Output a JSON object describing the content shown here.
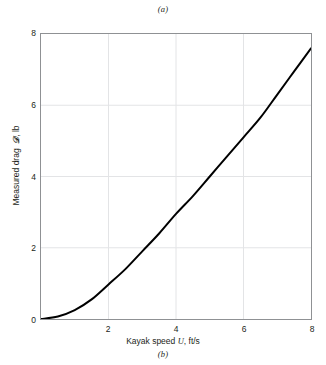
{
  "figure": {
    "caption_top": "(a)",
    "caption_bottom": "(b)",
    "background_color": "#ffffff",
    "frame_color": "#8f9194",
    "grid_color": "#e3e4e6",
    "curve_color": "#000000"
  },
  "axes": {
    "xlabel_prefix": "Kayak speed ",
    "xlabel_symbol": "U",
    "xlabel_suffix": ", ft/s",
    "ylabel_prefix": "Measured drag ",
    "ylabel_symbol": " 𝒟",
    "ylabel_suffix": ", lb",
    "xticks": [
      "2",
      "4",
      "6",
      "8"
    ],
    "yticks": [
      "0",
      "2",
      "4",
      "6",
      "8"
    ]
  },
  "chart_data": {
    "type": "line",
    "title": "",
    "subtitle": "",
    "xlabel": "Kayak speed U, ft/s",
    "ylabel": "Measured drag 𝒟, lb",
    "xlim": [
      0,
      8
    ],
    "ylim": [
      0,
      8
    ],
    "xticks": [
      2,
      4,
      6,
      8
    ],
    "yticks": [
      0,
      2,
      4,
      6,
      8
    ],
    "grid": true,
    "legend": "none",
    "series": [
      {
        "name": "Measured drag vs kayak speed",
        "color": "#000000",
        "linewidth": 2,
        "x": [
          0,
          0.5,
          1,
          1.5,
          2,
          2.5,
          3,
          3.5,
          4,
          4.5,
          5,
          5.5,
          6,
          6.5,
          7,
          7.5,
          8
        ],
        "values": [
          0.0,
          0.07,
          0.25,
          0.55,
          0.97,
          1.4,
          1.9,
          2.4,
          2.95,
          3.45,
          4.0,
          4.55,
          5.1,
          5.65,
          6.3,
          6.95,
          7.6
        ]
      }
    ],
    "annotations": [
      "(a)",
      "(b)"
    ]
  }
}
